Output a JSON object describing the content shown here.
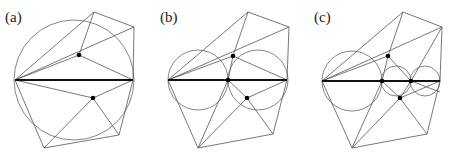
{
  "panels": [
    {
      "label": "(a)",
      "label_pos": [
        5,
        22
      ],
      "bold_segment": [
        [
          15,
          80
        ],
        [
          133,
          80
        ]
      ],
      "circles": [
        {
          "cx": 74,
          "cy": 80,
          "r": 60
        }
      ],
      "dots": [
        [
          79,
          55
        ],
        [
          93,
          98
        ]
      ],
      "edges": [
        [
          [
            15,
            80
          ],
          [
            94,
            12
          ]
        ],
        [
          [
            94,
            12
          ],
          [
            134,
            27
          ]
        ],
        [
          [
            134,
            27
          ],
          [
            133,
            80
          ]
        ],
        [
          [
            15,
            80
          ],
          [
            134,
            27
          ]
        ],
        [
          [
            15,
            80
          ],
          [
            79,
            55
          ]
        ],
        [
          [
            79,
            55
          ],
          [
            94,
            12
          ]
        ],
        [
          [
            79,
            55
          ],
          [
            133,
            80
          ]
        ],
        [
          [
            15,
            80
          ],
          [
            44,
            148
          ]
        ],
        [
          [
            44,
            148
          ],
          [
            119,
            135
          ]
        ],
        [
          [
            119,
            135
          ],
          [
            133,
            80
          ]
        ],
        [
          [
            15,
            80
          ],
          [
            93,
            98
          ]
        ],
        [
          [
            93,
            98
          ],
          [
            133,
            80
          ]
        ],
        [
          [
            93,
            98
          ],
          [
            44,
            148
          ]
        ],
        [
          [
            93,
            98
          ],
          [
            119,
            135
          ]
        ]
      ]
    },
    {
      "label": "(b)",
      "label_pos": [
        160,
        22
      ],
      "bold_segment": [
        [
          168,
          80
        ],
        [
          287,
          80
        ]
      ],
      "circles": [
        {
          "cx": 198,
          "cy": 80,
          "r": 30
        },
        {
          "cx": 258,
          "cy": 80,
          "r": 30
        }
      ],
      "dots": [
        [
          233,
          56
        ],
        [
          228,
          80
        ],
        [
          247,
          98
        ]
      ],
      "edges": [
        [
          [
            168,
            80
          ],
          [
            248,
            12
          ]
        ],
        [
          [
            248,
            12
          ],
          [
            289,
            27
          ]
        ],
        [
          [
            289,
            27
          ],
          [
            287,
            80
          ]
        ],
        [
          [
            168,
            80
          ],
          [
            289,
            27
          ]
        ],
        [
          [
            168,
            80
          ],
          [
            233,
            56
          ]
        ],
        [
          [
            233,
            56
          ],
          [
            248,
            12
          ]
        ],
        [
          [
            233,
            56
          ],
          [
            287,
            80
          ]
        ],
        [
          [
            233,
            56
          ],
          [
            228,
            80
          ]
        ],
        [
          [
            168,
            80
          ],
          [
            198,
            148
          ]
        ],
        [
          [
            198,
            148
          ],
          [
            273,
            134
          ]
        ],
        [
          [
            273,
            134
          ],
          [
            287,
            80
          ]
        ],
        [
          [
            228,
            80
          ],
          [
            198,
            148
          ]
        ],
        [
          [
            228,
            80
          ],
          [
            247,
            98
          ]
        ],
        [
          [
            247,
            98
          ],
          [
            287,
            80
          ]
        ],
        [
          [
            247,
            98
          ],
          [
            198,
            148
          ]
        ],
        [
          [
            247,
            98
          ],
          [
            273,
            134
          ]
        ]
      ]
    },
    {
      "label": "(c)",
      "label_pos": [
        314,
        22
      ],
      "bold_segment": [
        [
          322,
          81
        ],
        [
          440,
          81
        ]
      ],
      "circles": [
        {
          "cx": 352,
          "cy": 81,
          "r": 30
        },
        {
          "cx": 396,
          "cy": 81,
          "r": 15
        },
        {
          "cx": 425,
          "cy": 81,
          "r": 15
        }
      ],
      "dots": [
        [
          388,
          56
        ],
        [
          382,
          81
        ],
        [
          411,
          81
        ],
        [
          400,
          98
        ]
      ],
      "edges": [
        [
          [
            322,
            81
          ],
          [
            403,
            12
          ]
        ],
        [
          [
            403,
            12
          ],
          [
            442,
            27
          ]
        ],
        [
          [
            442,
            27
          ],
          [
            440,
            81
          ]
        ],
        [
          [
            322,
            81
          ],
          [
            442,
            27
          ]
        ],
        [
          [
            322,
            81
          ],
          [
            388,
            56
          ]
        ],
        [
          [
            388,
            56
          ],
          [
            403,
            12
          ]
        ],
        [
          [
            388,
            56
          ],
          [
            382,
            81
          ]
        ],
        [
          [
            388,
            56
          ],
          [
            411,
            81
          ]
        ],
        [
          [
            411,
            81
          ],
          [
            442,
            27
          ]
        ],
        [
          [
            322,
            81
          ],
          [
            352,
            148
          ]
        ],
        [
          [
            352,
            148
          ],
          [
            427,
            134
          ]
        ],
        [
          [
            427,
            134
          ],
          [
            440,
            81
          ]
        ],
        [
          [
            382,
            81
          ],
          [
            352,
            148
          ]
        ],
        [
          [
            382,
            81
          ],
          [
            400,
            98
          ]
        ],
        [
          [
            400,
            98
          ],
          [
            411,
            81
          ]
        ],
        [
          [
            400,
            98
          ],
          [
            352,
            148
          ]
        ],
        [
          [
            400,
            98
          ],
          [
            427,
            134
          ]
        ],
        [
          [
            411,
            81
          ],
          [
            440,
            92
          ]
        ],
        [
          [
            400,
            98
          ],
          [
            440,
            81
          ]
        ]
      ]
    }
  ]
}
